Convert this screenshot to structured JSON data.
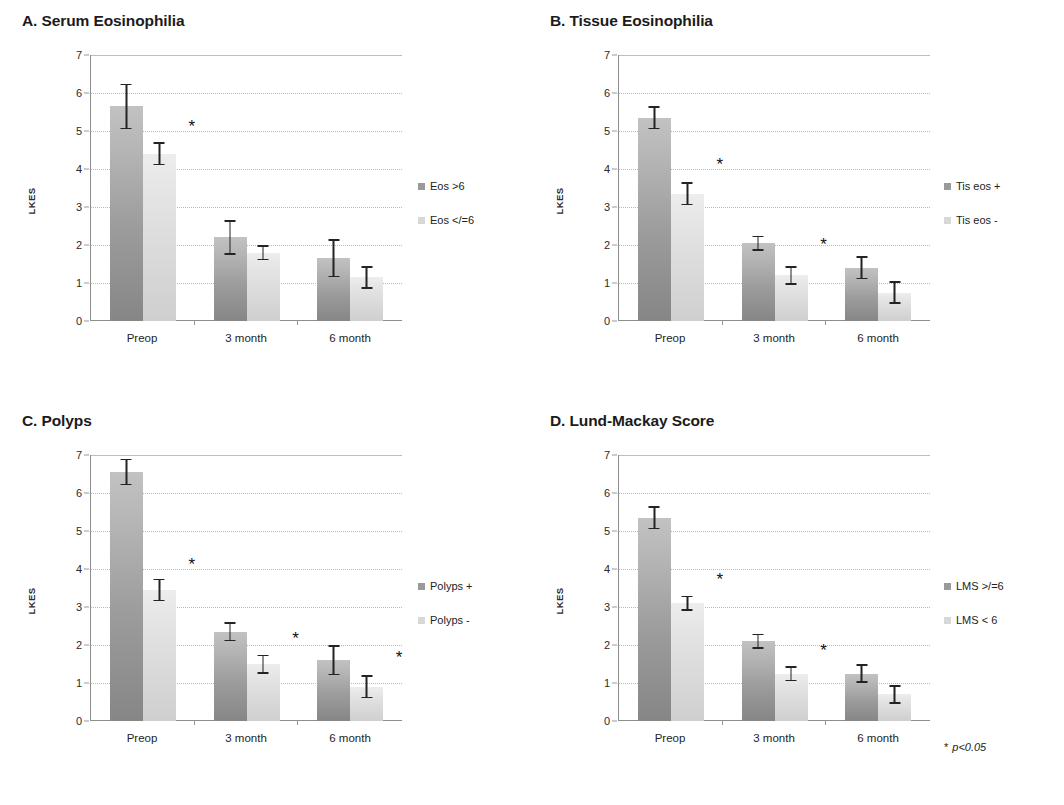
{
  "figure": {
    "significance_note": "p<0.05",
    "significance_marker": "*",
    "axis_label": "LKES",
    "categories": [
      "Preop",
      "3 month",
      "6 month"
    ],
    "y_ticks": [
      "0",
      "1",
      "2",
      "3",
      "4",
      "5",
      "6",
      "7"
    ],
    "colors": {
      "series1": "#9a9a9a",
      "series2": "#d8d8d8",
      "error": "#232323"
    }
  },
  "panels": [
    {
      "id": "a",
      "title": "A. Serum Eosinophilia",
      "legend": [
        {
          "label": "Eos >6",
          "swatch": "series1"
        },
        {
          "label": "Eos </=6",
          "swatch": "series2"
        }
      ],
      "chart_data": {
        "type": "bar",
        "title": "A. Serum Eosinophilia",
        "xlabel": "",
        "ylabel": "LKES",
        "ylim": [
          0,
          7
        ],
        "ytick_step": 1,
        "grid": true,
        "legend_position": "right",
        "categories": [
          "Preop",
          "3 month",
          "6 month"
        ],
        "series": [
          {
            "name": "Eos >6",
            "values": [
              5.65,
              2.2,
              1.65
            ],
            "errors": [
              0.6,
              0.45,
              0.5
            ]
          },
          {
            "name": "Eos </=6",
            "values": [
              4.4,
              1.8,
              1.15
            ],
            "errors": [
              0.3,
              0.2,
              0.3
            ]
          }
        ],
        "annotations": [
          {
            "category": "Preop",
            "series": "Eos </=6",
            "marker": "*",
            "value": 5.1
          }
        ]
      }
    },
    {
      "id": "b",
      "title": "B. Tissue Eosinophilia",
      "legend": [
        {
          "label": "Tis eos +",
          "swatch": "series1"
        },
        {
          "label": "Tis eos -",
          "swatch": "series2"
        }
      ],
      "chart_data": {
        "type": "bar",
        "title": "B. Tissue Eosinophilia",
        "xlabel": "",
        "ylabel": "LKES",
        "ylim": [
          0,
          7
        ],
        "ytick_step": 1,
        "grid": true,
        "legend_position": "right",
        "categories": [
          "Preop",
          "3 month",
          "6 month"
        ],
        "series": [
          {
            "name": "Tis eos +",
            "values": [
              5.35,
              2.05,
              1.4
            ],
            "errors": [
              0.3,
              0.2,
              0.3
            ]
          },
          {
            "name": "Tis eos -",
            "values": [
              3.35,
              1.2,
              0.75
            ],
            "errors": [
              0.3,
              0.25,
              0.3
            ]
          }
        ],
        "annotations": [
          {
            "category": "Preop",
            "series": "Tis eos -",
            "marker": "*",
            "value": 4.1
          },
          {
            "category": "3 month",
            "series": "Tis eos -",
            "marker": "*",
            "value": 2.0
          }
        ]
      }
    },
    {
      "id": "c",
      "title": "C. Polyps",
      "legend": [
        {
          "label": "Polyps +",
          "swatch": "series1"
        },
        {
          "label": "Polyps -",
          "swatch": "series2"
        }
      ],
      "chart_data": {
        "type": "bar",
        "title": "C. Polyps",
        "xlabel": "",
        "ylabel": "LKES",
        "ylim": [
          0,
          7
        ],
        "ytick_step": 1,
        "grid": true,
        "legend_position": "right",
        "categories": [
          "Preop",
          "3 month",
          "6 month"
        ],
        "series": [
          {
            "name": "Polyps +",
            "values": [
              6.55,
              2.35,
              1.6
            ],
            "errors": [
              0.35,
              0.25,
              0.4
            ]
          },
          {
            "name": "Polyps -",
            "values": [
              3.45,
              1.5,
              0.9
            ],
            "errors": [
              0.3,
              0.25,
              0.3
            ]
          }
        ],
        "annotations": [
          {
            "category": "Preop",
            "series": "Polyps -",
            "marker": "*",
            "value": 4.1
          },
          {
            "category": "3 month",
            "series": "Polyps -",
            "marker": "*",
            "value": 2.15
          },
          {
            "category": "6 month",
            "series": "Polyps -",
            "marker": "*",
            "value": 1.65
          }
        ]
      }
    },
    {
      "id": "d",
      "title": "D. Lund-Mackay Score",
      "legend": [
        {
          "label": "LMS >/=6",
          "swatch": "series1"
        },
        {
          "label": "LMS < 6",
          "swatch": "series2"
        }
      ],
      "footnote": {
        "marker": "*",
        "text": "p<0.05"
      },
      "chart_data": {
        "type": "bar",
        "title": "D. Lund-Mackay Score",
        "xlabel": "",
        "ylabel": "LKES",
        "ylim": [
          0,
          7
        ],
        "ytick_step": 1,
        "grid": true,
        "legend_position": "right",
        "categories": [
          "Preop",
          "3 month",
          "6 month"
        ],
        "series": [
          {
            "name": "LMS >/=6",
            "values": [
              5.35,
              2.1,
              1.25
            ],
            "errors": [
              0.3,
              0.2,
              0.25
            ]
          },
          {
            "name": "LMS < 6",
            "values": [
              3.1,
              1.25,
              0.7
            ],
            "errors": [
              0.2,
              0.2,
              0.25
            ]
          }
        ],
        "annotations": [
          {
            "category": "Preop",
            "series": "LMS < 6",
            "marker": "*",
            "value": 3.7
          },
          {
            "category": "3 month",
            "series": "LMS < 6",
            "marker": "*",
            "value": 1.85
          }
        ]
      }
    }
  ]
}
